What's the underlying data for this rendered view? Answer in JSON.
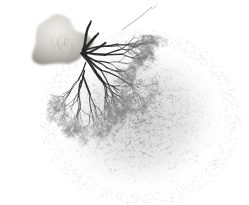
{
  "image": {
    "kind": "photomicrograph",
    "subject": "vascular corrosion cast",
    "modality": "grayscale photograph",
    "width": 249,
    "height": 205,
    "background_color": "#ffffff",
    "caption": "Grayscale photograph of a branching vascular corrosion cast specimen on a plain white background"
  },
  "palette": {
    "background": "#ffffff",
    "paper_tint": "#fdfdfd",
    "hilum_highlight": "#e8e6e2",
    "hilum_midtone": "#c9c5bf",
    "hilum_shadow": "#9c9790",
    "trunk_dark": "#3a3a3a",
    "trunk_darkest": "#232323",
    "branch_mid": "#6f6f6f",
    "capillary_haze": "#8e8e8e",
    "capillary_faint": "#b8b8b8"
  },
  "structures": [
    {
      "id": "hilum",
      "label": "pale lobed hilum",
      "description": "Smooth pale gray lobed mass at the upper left where the feeding vessel enters",
      "center_x": 63,
      "center_y": 42,
      "radius_x": 30,
      "radius_y": 24,
      "tone": "#cfccc6"
    },
    {
      "id": "arterial-trunks",
      "label": "arterial trunks",
      "description": "Thick dark vessel trunks radiating from the hilum toward the right and downward",
      "origin_x": 84,
      "origin_y": 52,
      "count": 9,
      "tone": "#333333"
    },
    {
      "id": "capillary-bed",
      "label": "dense capillary bed",
      "description": "Fine fuzzy arborizing capillary network occupying the right and lower portion of the specimen",
      "center_x": 140,
      "center_y": 118,
      "radius_x": 88,
      "radius_y": 78,
      "tone": "#7c7c7c"
    },
    {
      "id": "apical-branch",
      "label": "apical branch",
      "description": "Slender branch extending upward to the top edge of the frame",
      "tip_x": 152,
      "tip_y": 3,
      "tone": "#5a5a5a"
    }
  ],
  "extents": {
    "left": 18,
    "right": 228,
    "top": 2,
    "bottom": 198,
    "widest_row_y": 120,
    "notes": "Specimen is fully contained within the frame with white margin on all sides"
  },
  "render": {
    "seed": 20240517,
    "trunk_count": 9,
    "branch_depth": 8,
    "capillary_tuft_count": 2600,
    "speckle_count": 9000
  },
  "overlay": {
    "has_scale_bar": false,
    "has_labels": false,
    "has_annotations": false,
    "has_border": false,
    "text_items": []
  }
}
